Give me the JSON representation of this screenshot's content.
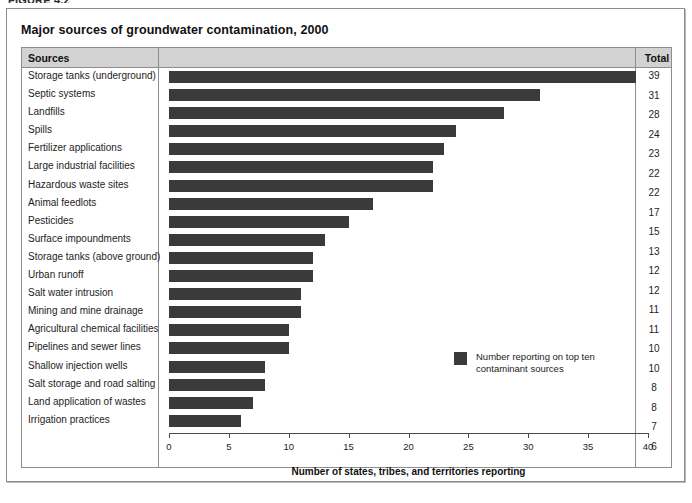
{
  "figure_caption": "FIGURE 4.2",
  "title": "Major sources of groundwater contamination, 2000",
  "table": {
    "header": {
      "sources": "Sources",
      "total": "Total"
    }
  },
  "legend": {
    "label": "Number reporting on top ten contaminant sources",
    "swatch_color": "#3a3a3a"
  },
  "chart_data": {
    "type": "bar",
    "orientation": "horizontal",
    "title": "Major sources of groundwater contamination, 2000",
    "xlabel": "Number of states, tribes, and territories reporting",
    "ylabel": "",
    "xlim": [
      0,
      40
    ],
    "xticks": [
      0,
      5,
      10,
      15,
      20,
      25,
      30,
      35,
      40
    ],
    "grid": false,
    "legend_position": "inside-right",
    "series_name": "Number reporting on top ten contaminant sources",
    "bar_color": "#3a3a3a",
    "categories": [
      "Storage tanks (underground)",
      "Septic systems",
      "Landfills",
      "Spills",
      "Fertilizer applications",
      "Large industrial facilities",
      "Hazardous waste sites",
      "Animal feedlots",
      "Pesticides",
      "Surface impoundments",
      "Storage tanks (above ground)",
      "Urban runoff",
      "Salt water intrusion",
      "Mining and mine drainage",
      "Agricultural chemical facilities",
      "Pipelines and sewer lines",
      "Shallow injection wells",
      "Salt storage and road salting",
      "Land application of wastes",
      "Irrigation practices"
    ],
    "values": [
      39,
      31,
      28,
      24,
      23,
      22,
      22,
      17,
      15,
      13,
      12,
      12,
      11,
      11,
      10,
      10,
      8,
      8,
      7,
      6
    ]
  }
}
